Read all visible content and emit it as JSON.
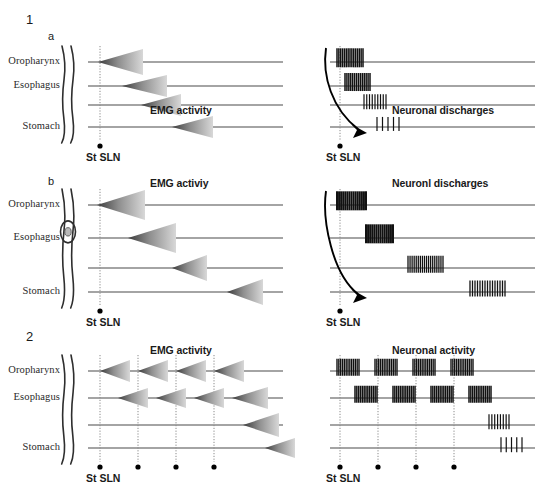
{
  "figure": {
    "width": 544,
    "height": 475,
    "background": "#ffffff",
    "line_color": "#4a4a4a",
    "tick_color": "#111111",
    "arrow_dark": "#3a3a3a",
    "arrow_light": "#d8d8d8",
    "stim_line_color": "#8a8a8a"
  },
  "row_labels": [
    "Oropharynx",
    "Esophagus",
    "Stomach"
  ],
  "stim_label": "St SLN",
  "panels": [
    {
      "id": "panel-1",
      "number": "1",
      "subpanels": [
        {
          "id": "panel-1a",
          "letter": "a",
          "left_title": "EMG activity",
          "right_title": "Neuronal discharges",
          "anatomy": "tube-plain",
          "stim_dots": 1,
          "emg_arrows": [
            {
              "row": 0,
              "tip_x": 98,
              "base_x": 143,
              "half_height": 13
            },
            {
              "row": 1,
              "tip_x": 122,
              "base_x": 167,
              "half_height": 11
            },
            {
              "row": 2,
              "tip_x": 141,
              "base_x": 181,
              "half_height": 11
            },
            {
              "row": 3,
              "tip_x": 172,
              "base_x": 213,
              "half_height": 11
            }
          ],
          "bursts": [
            {
              "row": 0,
              "x": 337,
              "width": 26,
              "ticks": 15,
              "height": 19,
              "weight": 1.5
            },
            {
              "row": 1,
              "x": 345,
              "width": 25,
              "ticks": 14,
              "height": 18,
              "weight": 1.5
            },
            {
              "row": 2,
              "x": 364,
              "width": 22,
              "ticks": 9,
              "height": 15,
              "weight": 1.2
            },
            {
              "row": 3,
              "x": 377,
              "width": 22,
              "ticks": 5,
              "height": 14,
              "weight": 1.2
            }
          ],
          "curve_arrow": true
        },
        {
          "id": "panel-1b",
          "letter": "b",
          "left_title": "EMG activiy",
          "right_title": "Neuronl discharges",
          "anatomy": "tube-bolus",
          "stim_dots": 1,
          "emg_arrows": [
            {
              "row": 0,
              "tip_x": 97,
              "base_x": 145,
              "half_height": 15
            },
            {
              "row": 1,
              "tip_x": 128,
              "base_x": 176,
              "half_height": 15
            },
            {
              "row": 2,
              "tip_x": 172,
              "base_x": 207,
              "half_height": 13
            },
            {
              "row": 3,
              "tip_x": 227,
              "base_x": 263,
              "half_height": 13
            }
          ],
          "bursts": [
            {
              "row": 0,
              "x": 337,
              "width": 29,
              "ticks": 15,
              "height": 19,
              "weight": 2.0
            },
            {
              "row": 1,
              "x": 366,
              "width": 27,
              "ticks": 14,
              "height": 19,
              "weight": 2.0
            },
            {
              "row": 2,
              "x": 408,
              "width": 35,
              "ticks": 18,
              "height": 17,
              "weight": 1.3
            },
            {
              "row": 3,
              "x": 470,
              "width": 35,
              "ticks": 15,
              "height": 16,
              "weight": 1.3
            }
          ],
          "curve_arrow": true
        }
      ]
    },
    {
      "id": "panel-2",
      "number": "2",
      "subpanels": [
        {
          "id": "panel-2a",
          "letter": "",
          "left_title": "EMG activity",
          "right_title": "Neuronal activity",
          "anatomy": "tube-plain",
          "stim_dots": 4,
          "emg_arrows": [
            {
              "row": 0,
              "tip_x": 100,
              "base_x": 130,
              "half_height": 11
            },
            {
              "row": 0,
              "tip_x": 138,
              "base_x": 168,
              "half_height": 11
            },
            {
              "row": 0,
              "tip_x": 176,
              "base_x": 206,
              "half_height": 11
            },
            {
              "row": 0,
              "tip_x": 214,
              "base_x": 244,
              "half_height": 11
            },
            {
              "row": 1,
              "tip_x": 118,
              "base_x": 148,
              "half_height": 10
            },
            {
              "row": 1,
              "tip_x": 156,
              "base_x": 186,
              "half_height": 10
            },
            {
              "row": 1,
              "tip_x": 194,
              "base_x": 224,
              "half_height": 10
            },
            {
              "row": 1,
              "tip_x": 232,
              "base_x": 268,
              "half_height": 11
            },
            {
              "row": 2,
              "tip_x": 243,
              "base_x": 279,
              "half_height": 12
            },
            {
              "row": 3,
              "tip_x": 265,
              "base_x": 295,
              "half_height": 10
            }
          ],
          "bursts": [
            {
              "row": 0,
              "x": 337,
              "width": 22,
              "ticks": 13,
              "height": 17,
              "weight": 1.4
            },
            {
              "row": 0,
              "x": 375,
              "width": 22,
              "ticks": 13,
              "height": 17,
              "weight": 1.4
            },
            {
              "row": 0,
              "x": 413,
              "width": 22,
              "ticks": 13,
              "height": 17,
              "weight": 1.4
            },
            {
              "row": 0,
              "x": 451,
              "width": 22,
              "ticks": 13,
              "height": 17,
              "weight": 1.4
            },
            {
              "row": 1,
              "x": 355,
              "width": 22,
              "ticks": 13,
              "height": 17,
              "weight": 1.5
            },
            {
              "row": 1,
              "x": 393,
              "width": 22,
              "ticks": 13,
              "height": 17,
              "weight": 1.5
            },
            {
              "row": 1,
              "x": 431,
              "width": 22,
              "ticks": 13,
              "height": 17,
              "weight": 1.5
            },
            {
              "row": 1,
              "x": 469,
              "width": 22,
              "ticks": 13,
              "height": 17,
              "weight": 1.5
            },
            {
              "row": 2,
              "x": 489,
              "width": 20,
              "ticks": 8,
              "height": 15,
              "weight": 1.2
            },
            {
              "row": 3,
              "x": 501,
              "width": 21,
              "ticks": 5,
              "height": 15,
              "weight": 1.2
            }
          ],
          "curve_arrow": false
        }
      ]
    }
  ]
}
